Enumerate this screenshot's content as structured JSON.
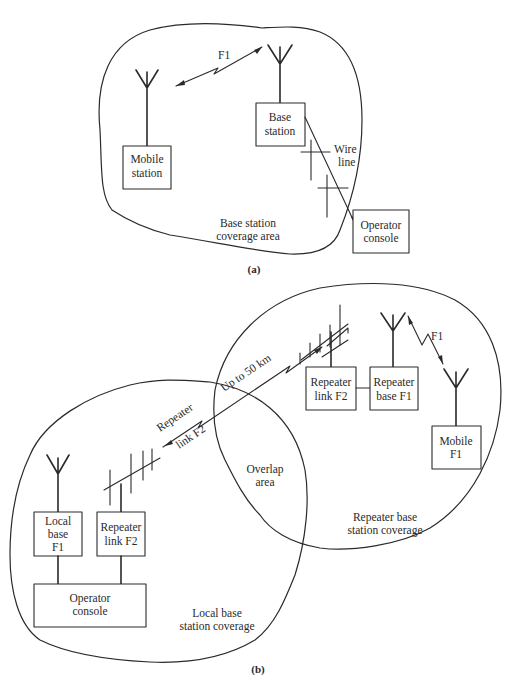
{
  "figure": {
    "colors": {
      "ink": "#2a2a2a",
      "background": "#ffffff"
    },
    "panel_a": {
      "caption": "(a)",
      "region_label": [
        "Base station",
        "coverage area"
      ],
      "link_label": "F1",
      "mobile_station": [
        "Mobile",
        "station"
      ],
      "base_station": [
        "Base",
        "station"
      ],
      "wire_line": [
        "Wire",
        "line"
      ],
      "operator_console": [
        "Operator",
        "console"
      ]
    },
    "panel_b": {
      "caption": "(b)",
      "local_region_label": [
        "Local base",
        "station coverage"
      ],
      "repeater_region_label": [
        "Repeater base",
        "station coverage"
      ],
      "overlap_label": [
        "Overlap",
        "area"
      ],
      "local_base": [
        "Local",
        "base",
        "F1"
      ],
      "repeater_link_left": [
        "Repeater",
        "link F2"
      ],
      "operator_console": [
        "Operator",
        "console"
      ],
      "repeater_link_label_1": "Repeater",
      "repeater_link_label_2": "link F2",
      "distance_label": "Up to 50 km",
      "repeater_link_right": [
        "Repeater",
        "link F2"
      ],
      "repeater_base": [
        "Repeater",
        "base F1"
      ],
      "mobile": [
        "Mobile",
        "F1"
      ],
      "mobile_link_label": "F1"
    }
  }
}
